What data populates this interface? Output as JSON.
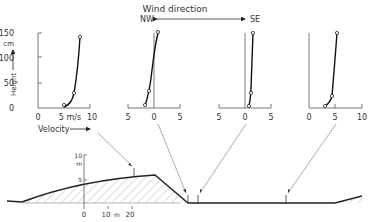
{
  "wind_direction": {
    "label": "Wind direction",
    "left": "NW",
    "right": "SE"
  },
  "profile_axes": {
    "y_label": "Height",
    "y_unit": "cm",
    "y_ticks": [
      "0",
      "50",
      "100",
      "150"
    ],
    "x_label": "Velocity",
    "x_unit": "m/s"
  },
  "profiles": [
    {
      "id": "p1",
      "x_ticks": [
        "0",
        "5 m/s",
        "10"
      ],
      "points": [
        [
          4.5,
          5
        ],
        [
          6.5,
          30
        ],
        [
          8.5,
          135
        ]
      ]
    },
    {
      "id": "p2",
      "x_ticks": [
        "5",
        "0",
        "5"
      ],
      "points": [
        [
          -2,
          5
        ],
        [
          -1,
          30
        ],
        [
          1,
          145
        ]
      ]
    },
    {
      "id": "p3",
      "x_ticks": [
        "5",
        "0",
        "5"
      ],
      "points": [
        [
          0.5,
          5
        ],
        [
          1,
          30
        ],
        [
          1.5,
          145
        ]
      ]
    },
    {
      "id": "p4",
      "x_ticks": [
        "0",
        "5",
        "10"
      ],
      "points": [
        [
          3,
          5
        ],
        [
          4.5,
          25
        ],
        [
          5.5,
          145
        ]
      ]
    }
  ],
  "cross_section": {
    "y_unit": "m",
    "y_ticks": [
      "10",
      "5"
    ],
    "x_ticks": [
      "0",
      "10",
      "m",
      "20"
    ]
  }
}
